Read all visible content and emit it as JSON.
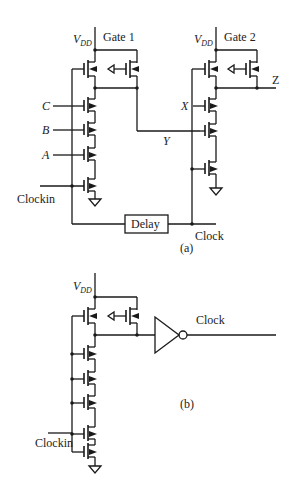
{
  "diagram": {
    "panel_a": {
      "caption": "(a)",
      "gate1": {
        "title": "Gate 1",
        "supply": "V",
        "supply_sub": "DD",
        "inputs": [
          "C",
          "B",
          "A"
        ],
        "clock_input": "Clockin"
      },
      "gate2": {
        "title": "Gate 2",
        "supply": "V",
        "supply_sub": "DD",
        "inputs": [
          "X",
          "Y"
        ],
        "output": "Z"
      },
      "delay_label": "Delay",
      "clock_label": "Clock"
    },
    "panel_b": {
      "caption": "(b)",
      "supply": "V",
      "supply_sub": "DD",
      "clock_input": "Clockin",
      "output_label": "Clock"
    }
  }
}
